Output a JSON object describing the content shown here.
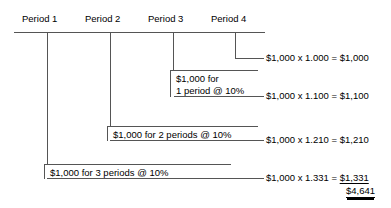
{
  "diagram": {
    "axis": {
      "labels": [
        {
          "text": "Period 1"
        },
        {
          "text": "Period 2"
        },
        {
          "text": "Period 3"
        },
        {
          "text": "Period 4"
        }
      ]
    },
    "callouts": [
      {
        "id": "one-period",
        "line1": "$1,000 for",
        "line2": "1 period @ 10%"
      },
      {
        "id": "two-periods",
        "line1": "$1,000 for 2 periods @ 10%"
      },
      {
        "id": "three-periods",
        "line1": "$1,000 for 3 periods @ 10%"
      }
    ],
    "formulas": [
      {
        "id": "f0",
        "text": "$1,000 x 1.000 = $1,000"
      },
      {
        "id": "f1",
        "text": "$1,000 x 1.100 = $1,100"
      },
      {
        "id": "f2",
        "text": "$1,000 x 1.210 = $1,210"
      }
    ],
    "final_formula": {
      "prefix": "$1,000 x 1.331 = ",
      "value": "$1,331"
    },
    "total": {
      "value": "$4,641"
    },
    "colors": {
      "line": "#555555",
      "text": "#000000",
      "background": "#ffffff"
    }
  }
}
